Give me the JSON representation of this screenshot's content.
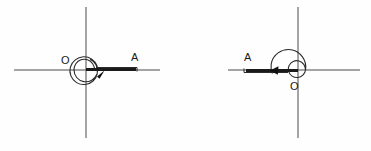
{
  "figure": {
    "background_color": "#fefefe",
    "line_color": "#4a4a4a",
    "ray_color": "#1a1a1a",
    "label_color": "#1a1a1a"
  },
  "panels": [
    {
      "id": "left-panel",
      "name": "positive-rotation-angle",
      "origin": {
        "x": 86,
        "y": 70
      },
      "x_axis": {
        "x1": 14,
        "y1": 70,
        "x2": 160,
        "y2": 70
      },
      "y_axis": {
        "x1": 86,
        "y1": 7,
        "x2": 86,
        "y2": 138
      },
      "vertex_label": {
        "text": "O",
        "x": 61,
        "y": 64
      },
      "terminal_label": {
        "text": "A",
        "x": 131,
        "y": 61
      },
      "ray": {
        "x1": 86,
        "y1": 70,
        "x2": 136,
        "y2": 70
      },
      "rotation": "counterclockwise",
      "turns": 1.9
    },
    {
      "id": "right-panel",
      "name": "negative-rotation-angle",
      "origin": {
        "x": 298,
        "y": 70
      },
      "x_axis": {
        "x1": 228,
        "y1": 70,
        "x2": 360,
        "y2": 70
      },
      "y_axis": {
        "x1": 298,
        "y1": 7,
        "x2": 298,
        "y2": 138
      },
      "vertex_label": {
        "text": "O",
        "x": 290,
        "y": 90
      },
      "terminal_label": {
        "text": "A",
        "x": 244,
        "y": 61
      },
      "ray": {
        "x1": 298,
        "y1": 70,
        "x2": 244,
        "y2": 70
      },
      "rotation": "counterclockwise",
      "turns": 1.55
    }
  ]
}
